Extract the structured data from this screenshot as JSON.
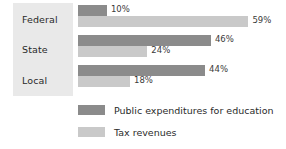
{
  "chart_data": {
    "type": "bar",
    "orientation": "horizontal",
    "title": "",
    "subtitle": "",
    "xlabel": "",
    "ylabel": "",
    "categories": [
      "Federal",
      "State",
      "Local"
    ],
    "series": [
      {
        "name": "Public expenditures for education",
        "color": "#8b8b8b",
        "values": [
          10,
          46,
          44
        ],
        "value_labels": [
          "10%",
          "46%",
          "44%"
        ]
      },
      {
        "name": "Tax revenues",
        "color": "#c9c9c9",
        "values": [
          59,
          24,
          18
        ],
        "value_labels": [
          "59%",
          "24%",
          "18%"
        ]
      }
    ],
    "xlim": [
      0,
      72
    ],
    "unit": "%",
    "grid": false,
    "legend_position": "bottom-left",
    "axis_ticks_visible": false
  },
  "panel": {
    "background_color": "#e9e9e9"
  },
  "legend": {
    "items": [
      {
        "label": "Public expenditures for education",
        "swatch": "dark-swatch-icon"
      },
      {
        "label": "Tax revenues",
        "swatch": "light-swatch-icon"
      }
    ]
  }
}
